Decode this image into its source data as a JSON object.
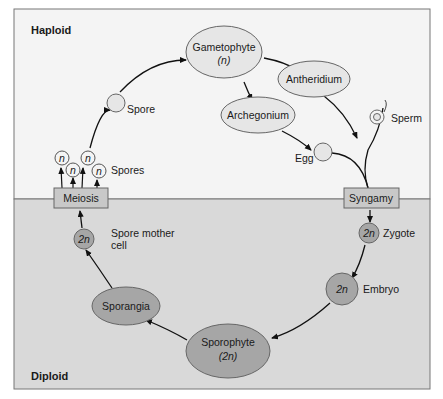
{
  "regions": {
    "haploid": {
      "label": "Haploid",
      "color": "#f4f4f4"
    },
    "diploid": {
      "label": "Diploid",
      "color": "#d9d9d9"
    }
  },
  "colors": {
    "haploid_fill": "#e6e6e6",
    "diploid_fill": "#a6a6a6",
    "box_fill": "#c8c8c8",
    "stroke": "#555555",
    "arrow": "#111111"
  },
  "nodes": {
    "gametophyte": {
      "label": "Gametophyte",
      "ploidy": "(n)"
    },
    "antheridium": {
      "label": "Antheridium"
    },
    "archegonium": {
      "label": "Archegonium"
    },
    "sperm": {
      "label": "Sperm"
    },
    "egg": {
      "label": "Egg"
    },
    "syngamy": {
      "label": "Syngamy"
    },
    "zygote": {
      "label": "Zygote",
      "ploidy": "2n"
    },
    "embryo": {
      "label": "Embryo",
      "ploidy": "2n"
    },
    "sporophyte": {
      "label": "Sporophyte",
      "ploidy": "(2n)"
    },
    "sporangia": {
      "label": "Sporangia"
    },
    "spore_mother_cell": {
      "label_line1": "Spore mother",
      "label_line2": "cell",
      "ploidy": "2n"
    },
    "meiosis": {
      "label": "Meiosis"
    },
    "spores": {
      "label": "Spores",
      "ploidy": "n"
    },
    "spore": {
      "label": "Spore"
    }
  }
}
